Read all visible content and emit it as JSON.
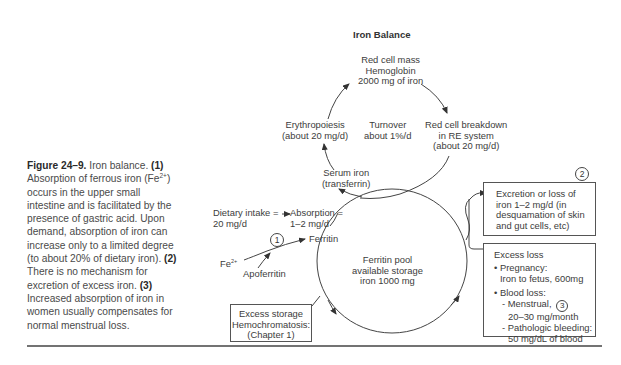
{
  "caption": {
    "figure_label": "Figure 24–9.",
    "intro": "Iron balance.",
    "n1": "(1)",
    "p1a": "Absorption of ferrous iron (Fe",
    "p1sup": "2+",
    "p1b": ") occurs in the upper small intestine and is facilitated by the presence of gastric acid. Upon demand, absorption of iron can increase only to a limited degree (to about 20% of dietary iron).",
    "n2": "(2)",
    "p2": "There is no mechanism for excretion of excess iron.",
    "n3": "(3)",
    "p3": "Increased absorption of iron in women usually compensates for normal menstrual loss."
  },
  "diagram": {
    "title": "Iron Balance",
    "red_cell_mass": [
      "Red cell mass",
      "Hemoglobin",
      "2000 mg of iron"
    ],
    "erythropoiesis": [
      "Erythropoiesis",
      "(about 20 mg/d)"
    ],
    "turnover": [
      "Turnover",
      "about 1%/d"
    ],
    "breakdown": [
      "Red cell breakdown",
      "in RE system",
      "(about 20 mg/d)"
    ],
    "serum_iron": [
      "Serum iron",
      "(transferrin)"
    ],
    "dietary_intake": [
      "Dietary intake =",
      "20 mg/d"
    ],
    "absorption": [
      "Absorption =",
      "1–2 mg/d"
    ],
    "ferritin": "Ferritin",
    "fe": "Fe",
    "fe_sup": "2+",
    "apoferritin": "Apoferritin",
    "ferritin_pool": [
      "Ferritin pool",
      "available storage",
      "iron 1000 mg"
    ],
    "excess_storage": [
      "Excess storage",
      "Hemochromatosis:",
      "(Chapter 1)"
    ],
    "excretion": [
      "Excretion or loss of",
      "iron 1–2 mg/d (in",
      "desquamation of skin",
      "and gut cells, etc)"
    ],
    "excess_loss": {
      "title": "Excess loss",
      "pregnancy": "• Pregnancy:",
      "pregnancy_detail": "Iron to fetus, 600mg",
      "blood_loss": "• Blood loss:",
      "menstrual": "- Menstrual,",
      "menstrual_detail": "20–30 mg/month",
      "pathologic": "- Pathologic bleeding:",
      "pathologic_detail": "50 mg/dL of blood"
    },
    "markers": {
      "m1": "1",
      "m2": "2",
      "m3": "3"
    }
  }
}
